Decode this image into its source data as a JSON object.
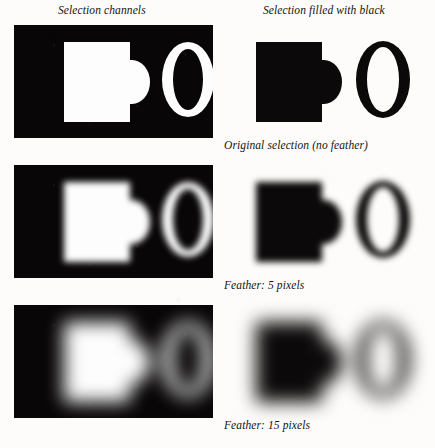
{
  "figure": {
    "background_color": "#fdfcfa",
    "ink_color": "#0b0909",
    "panel_black": "#080607",
    "mark_white": "#fdfdfd"
  },
  "headings": {
    "left": "Selection channels",
    "right": "Selection filled with black"
  },
  "captions": [
    "Original selection (no feather)",
    "Feather: 5 pixels",
    "Feather: 15 pixels"
  ],
  "rows": [
    {
      "feather_label": "Original selection (no feather)",
      "feather_pixels": 0,
      "channel_panel_name": "selection-channel-no-feather",
      "filled_panel_name": "selection-filled-no-feather",
      "shapes": [
        "d-shape",
        "o-letter"
      ]
    },
    {
      "feather_label": "Feather: 5 pixels",
      "feather_pixels": 5,
      "channel_panel_name": "selection-channel-feather-5",
      "filled_panel_name": "selection-filled-feather-5",
      "shapes": [
        "d-shape",
        "o-letter"
      ]
    },
    {
      "feather_label": "Feather: 15 pixels",
      "feather_pixels": 15,
      "channel_panel_name": "selection-channel-feather-15",
      "filled_panel_name": "selection-filled-feather-15",
      "shapes": [
        "d-shape",
        "o-letter"
      ]
    }
  ]
}
